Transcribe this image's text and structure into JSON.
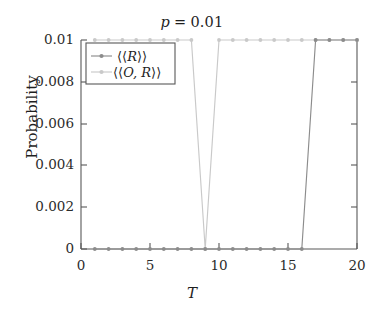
{
  "chart_data": {
    "type": "line",
    "xlabel": "T",
    "ylabel": "Probability",
    "xlim": [
      0,
      20
    ],
    "ylim": [
      0,
      0.01
    ],
    "grid": false,
    "legend_position": "upper left",
    "xticks": [
      {
        "value": 0,
        "label": "0"
      },
      {
        "value": 5,
        "label": "5"
      },
      {
        "value": 10,
        "label": "10"
      },
      {
        "value": 15,
        "label": "15"
      },
      {
        "value": 20,
        "label": "20"
      }
    ],
    "yticks": [
      {
        "value": 0,
        "label": "0"
      },
      {
        "value": 0.002,
        "label": "0.002"
      },
      {
        "value": 0.004,
        "label": "0.004"
      },
      {
        "value": 0.006,
        "label": "0.006"
      },
      {
        "value": 0.008,
        "label": "0.008"
      },
      {
        "value": 0.01,
        "label": "0.01"
      }
    ],
    "x": [
      1,
      2,
      3,
      4,
      5,
      6,
      7,
      8,
      9,
      10,
      11,
      12,
      13,
      14,
      15,
      16,
      17,
      18,
      19,
      20
    ],
    "series": [
      {
        "name": "⟨⟨R⟩⟩",
        "color": "#8c8c8c",
        "marker": "circle",
        "values": [
          0,
          0,
          0,
          0,
          0,
          0,
          0,
          0,
          0,
          0,
          0,
          0,
          0,
          0,
          0,
          0,
          0.01,
          0.01,
          0.01,
          0.01
        ]
      },
      {
        "name": "⟨⟨O, R⟩⟩",
        "color": "#c9c9c9",
        "marker": "circle",
        "values": [
          0.01,
          0.01,
          0.01,
          0.01,
          0.01,
          0.01,
          0.01,
          0.01,
          0.01,
          0.01,
          0.01,
          0.01,
          0.01,
          0.01,
          0.01,
          0.01,
          0.01,
          0.01,
          0.01,
          0.01
        ]
      }
    ]
  },
  "legend": {
    "entries": [
      {
        "label_left": "⟨⟨",
        "label_var": "R",
        "label_right": "⟩⟩"
      },
      {
        "label_left": "⟨⟨",
        "label_var": "O, R",
        "label_right": "⟩⟩"
      }
    ]
  },
  "title_parts": {
    "variable": "p",
    "equals": "=",
    "value": "0.01"
  }
}
